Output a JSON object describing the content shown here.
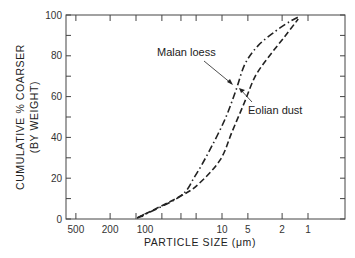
{
  "chart_data": {
    "type": "line",
    "title": "",
    "xlabel": "PARTICLE SIZE (μm)",
    "ylabel_line1": "CUMULATIVE  %  COARSER",
    "ylabel_line2": "(BY WEIGHT)",
    "x_scale": "log",
    "x_reversed": true,
    "x_ticks": [
      500,
      200,
      100,
      50,
      30,
      20,
      10,
      5,
      2,
      1
    ],
    "x_tick_labels": [
      "500",
      "200",
      "100",
      "10",
      "5",
      "2",
      "1"
    ],
    "x_labeled_values": [
      500,
      200,
      100,
      10,
      5,
      2,
      1
    ],
    "y_ticks": [
      0,
      10,
      20,
      30,
      40,
      50,
      60,
      70,
      80,
      90,
      100
    ],
    "y_tick_labels": [
      "0",
      "20",
      "40",
      "60",
      "80",
      "100"
    ],
    "ylim": [
      0,
      100
    ],
    "grid": false,
    "series": [
      {
        "name": "Malan loess",
        "style": "dash-dot",
        "x": [
          97,
          31,
          20.6,
          13.8,
          9.2,
          6.9,
          5.4,
          3.8,
          2.4,
          1.6,
          1.3
        ],
        "values": [
          0.5,
          11,
          21,
          34,
          49,
          63,
          76,
          85,
          92,
          97,
          99
        ]
      },
      {
        "name": "Eolian dust",
        "style": "dashed",
        "x": [
          97,
          31,
          18.9,
          10.5,
          7.6,
          5.5,
          4.1,
          2.8,
          1.9,
          1.3
        ],
        "values": [
          0.5,
          11,
          17,
          29,
          43,
          57,
          70,
          80,
          89,
          98
        ]
      }
    ],
    "annotations": [
      {
        "text": "Malan loess",
        "target_series": "Malan loess"
      },
      {
        "text": "Eolian dust",
        "target_series": "Eolian dust"
      }
    ]
  },
  "colors": {
    "line": "#222222",
    "axis": "#444444",
    "text": "#222222"
  }
}
